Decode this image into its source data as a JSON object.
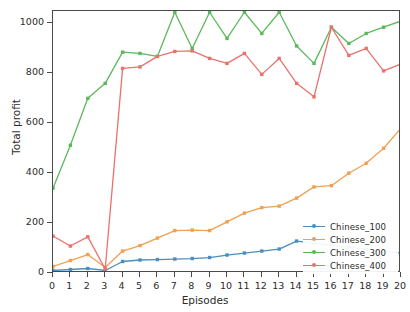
{
  "chart_data": {
    "type": "line",
    "title": "",
    "xlabel": "Episodes",
    "ylabel": "Total profit",
    "xlim": [
      0,
      20
    ],
    "ylim": [
      0,
      1050
    ],
    "xticks": [
      0,
      1,
      2,
      3,
      4,
      5,
      6,
      7,
      8,
      9,
      10,
      11,
      12,
      13,
      14,
      15,
      16,
      17,
      18,
      19,
      20
    ],
    "yticks": [
      0,
      200,
      400,
      600,
      800,
      1000
    ],
    "grid": false,
    "legend_position": "lower right",
    "x": [
      0,
      1,
      2,
      3,
      4,
      5,
      6,
      7,
      8,
      9,
      10,
      11,
      12,
      13,
      14,
      15,
      16,
      17,
      18,
      19,
      20
    ],
    "series": [
      {
        "name": "Chinese_100",
        "color": "#4c8fbd",
        "values": [
          10,
          14,
          18,
          10,
          46,
          52,
          54,
          56,
          58,
          62,
          72,
          80,
          88,
          96,
          128,
          120,
          112,
          104,
          96,
          88,
          80
        ]
      },
      {
        "name": "Chinese_200",
        "color": "#f0a050",
        "values": [
          26,
          50,
          74,
          22,
          88,
          110,
          140,
          170,
          172,
          170,
          205,
          240,
          262,
          268,
          300,
          345,
          350,
          400,
          440,
          500,
          580
        ]
      },
      {
        "name": "Chinese_300",
        "color": "#5cb85c",
        "values": [
          340,
          512,
          700,
          760,
          885,
          880,
          868,
          1045,
          900,
          1045,
          940,
          1045,
          960,
          1045,
          910,
          840,
          985,
          920,
          960,
          985,
          1010
        ]
      },
      {
        "name": "Chinese_400",
        "color": "#e8736e",
        "values": [
          148,
          108,
          145,
          16,
          820,
          826,
          868,
          888,
          890,
          860,
          840,
          880,
          796,
          860,
          760,
          706,
          985,
          872,
          900,
          810,
          838
        ]
      }
    ]
  },
  "legend": {
    "items": [
      {
        "label": "Chinese_100",
        "color": "#4c8fbd"
      },
      {
        "label": "Chinese_200",
        "color": "#f0a050"
      },
      {
        "label": "Chinese_300",
        "color": "#5cb85c"
      },
      {
        "label": "Chinese_400",
        "color": "#e8736e"
      }
    ]
  },
  "axes": {
    "x_label": "Episodes",
    "y_label": "Total profit",
    "x_tick_labels": [
      "0",
      "1",
      "2",
      "3",
      "4",
      "5",
      "6",
      "7",
      "8",
      "9",
      "10",
      "11",
      "12",
      "13",
      "14",
      "15",
      "16",
      "17",
      "18",
      "19",
      "20"
    ],
    "y_tick_labels": [
      "0",
      "200",
      "400",
      "600",
      "800",
      "1000"
    ]
  }
}
